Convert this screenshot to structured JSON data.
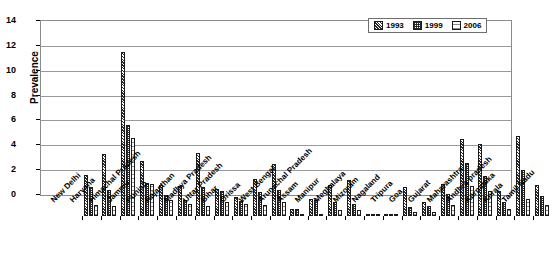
{
  "chart_data": {
    "type": "bar",
    "title": "",
    "xlabel": "",
    "ylabel": "Prevalence",
    "ylim": [
      0,
      14
    ],
    "ytick_values": [
      0,
      2,
      4,
      6,
      8,
      10,
      12,
      14
    ],
    "ytick_labels": [
      "0",
      "2",
      "4",
      "6",
      "8",
      "10",
      "12",
      "14"
    ],
    "grid": true,
    "legend_position": "top-right",
    "categories": [
      "New Delhi",
      "Haryana",
      "Himachal Pradesh",
      "Jammu",
      "Punjab",
      "Rajasthan",
      "Madhya Pradesh",
      "Uttar Pradesh",
      "Bihar",
      "Orissa",
      "West Bengal",
      "Arunachal Pradesh",
      "Assam",
      "Manipur",
      "Meghalaya",
      "Mizoram",
      "Nagaland",
      "Tripura",
      "Goa",
      "Gujarat",
      "Maharashtra",
      "Andhra pradesh",
      "Karnataka",
      "Kerala",
      "Tamil Nadu"
    ],
    "series": [
      {
        "name": "1993",
        "values": [
          3.3,
          5.0,
          13.2,
          4.4,
          2.5,
          2.45,
          5.1,
          2.2,
          1.5,
          3.0,
          4.2,
          0.6,
          1.4,
          2.5,
          2.9,
          0.15,
          0.1,
          2.3,
          1.1,
          2.6,
          6.2,
          5.8,
          2.0,
          6.4,
          2.5
        ]
      },
      {
        "name": "1999",
        "values": [
          2.3,
          2.1,
          7.3,
          2.65,
          1.7,
          1.3,
          2.3,
          2.0,
          1.2,
          1.9,
          2.1,
          0.55,
          1.3,
          1.1,
          1.0,
          0.1,
          0.05,
          0.7,
          0.8,
          1.8,
          4.3,
          3.2,
          1.1,
          3.7,
          1.6
        ]
      },
      {
        "name": "2006",
        "values": [
          0.9,
          0.8,
          6.25,
          2.6,
          1.25,
          1.0,
          0.8,
          1.1,
          1.0,
          0.9,
          1.1,
          0.2,
          0.2,
          0.45,
          0.5,
          0.05,
          0.05,
          0.3,
          0.35,
          0.9,
          2.4,
          2.0,
          0.6,
          1.4,
          0.9
        ]
      }
    ],
    "legend": [
      {
        "label": "1993",
        "pattern": "diagonal-hatch"
      },
      {
        "label": "1999",
        "pattern": "checker"
      },
      {
        "label": "2006",
        "pattern": "light-dots"
      }
    ]
  }
}
